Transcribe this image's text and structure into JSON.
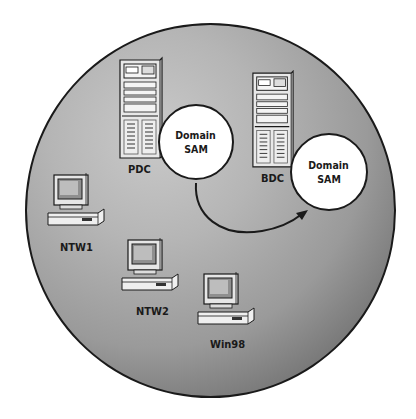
{
  "diagram": {
    "colors": {
      "sphere_light": "#c9c9c9",
      "sphere_dark": "#4a4a4a",
      "outline": "#1a1a1a",
      "bubble_fill": "#ffffff"
    },
    "servers": [
      {
        "label": "PDC",
        "sam_label_line1": "Domain",
        "sam_label_line2": "SAM"
      },
      {
        "label": "BDC",
        "sam_label_line1": "Domain",
        "sam_label_line2": "SAM"
      }
    ],
    "workstations": [
      {
        "label": "NTW1"
      },
      {
        "label": "NTW2"
      },
      {
        "label": "Win98"
      }
    ],
    "arrow": {
      "from": "PDC Domain SAM",
      "to": "BDC Domain SAM",
      "meaning": "replication"
    }
  }
}
